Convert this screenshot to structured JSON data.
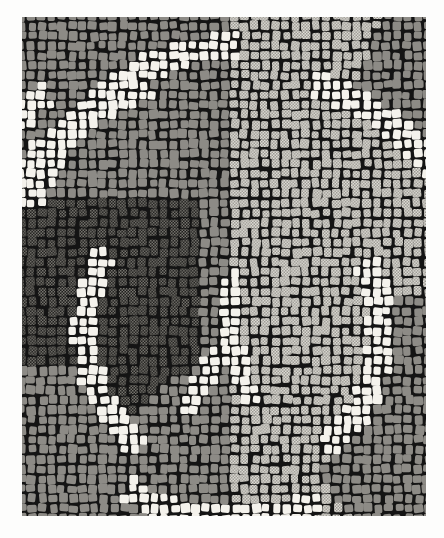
{
  "artwork": {
    "title": "Mosaic pavement with fan-scale (peltae) pattern",
    "medium": "stone tesserae mosaic",
    "orientation": "portrait",
    "image_width": 444,
    "image_height": 538
  },
  "canvas": {
    "background": "#fdfdfc",
    "panel": {
      "x": 22,
      "y": 17,
      "width": 404,
      "height": 499
    },
    "grout_color": "#141414",
    "paper_color": "#fdfdfc"
  },
  "palette": {
    "white_tessera": "#f4f2ec",
    "light_gray_tessera": "#c9c7c0",
    "mid_gray_tessera": "#8d8b86",
    "dark_tessera": "#3b3a38",
    "grout": "#141414",
    "halftone_dot": "#5e5c59"
  },
  "tessera": {
    "nominal_size": 8.5,
    "gap": 2.2,
    "corner_radius": 1.8,
    "jitter": 0.22
  },
  "regions": [
    {
      "id": "field-upper-left",
      "name": "upper-left mid-gray fan field",
      "fill": "mid_gray_tessera",
      "texture": "solid"
    },
    {
      "id": "field-upper-right",
      "name": "upper-right light-gray stippled field",
      "fill": "light_gray_tessera",
      "texture": "halftone"
    },
    {
      "id": "field-left-dark",
      "name": "left dark stippled fan field",
      "fill": "dark_tessera",
      "texture": "halftone"
    },
    {
      "id": "field-right-mid",
      "name": "right mid-gray fan field",
      "fill": "mid_gray_tessera",
      "texture": "solid"
    },
    {
      "id": "field-lower-left",
      "name": "lower-left mid-gray fan field",
      "fill": "mid_gray_tessera",
      "texture": "solid"
    },
    {
      "id": "field-lower-right",
      "name": "lower-right light-gray stippled field",
      "fill": "light_gray_tessera",
      "texture": "halftone"
    }
  ],
  "arcs": [
    {
      "id": "arc-top-left",
      "name": "large white arc band sweeping across upper-left",
      "band_width": 26,
      "fill": "white_tessera",
      "center": [
        232,
        332
      ],
      "radius": 268,
      "start_deg": 150,
      "end_deg": 248
    },
    {
      "id": "arc-upper-right",
      "name": "white arc band bounding upper-right field",
      "band_width": 24,
      "fill": "white_tessera",
      "center": [
        232,
        332
      ],
      "radius": 268,
      "start_deg": 292,
      "end_deg": 352
    },
    {
      "id": "arc-lower-left",
      "name": "white arc band bounding lower-left field",
      "band_width": 25,
      "fill": "white_tessera",
      "center": [
        232,
        332
      ],
      "radius": 150,
      "start_deg": 150,
      "end_deg": 215
    },
    {
      "id": "arc-lower-right",
      "name": "white arc band bounding lower-right field",
      "band_width": 25,
      "fill": "white_tessera",
      "center": [
        232,
        332
      ],
      "radius": 150,
      "start_deg": 330,
      "end_deg": 30
    },
    {
      "id": "arc-center-spoke",
      "name": "white spoke converging at central node",
      "band_width": 22,
      "fill": "white_tessera"
    }
  ],
  "nodes": [
    {
      "id": "node-center",
      "name": "central convergence point",
      "x": 232,
      "y": 332
    },
    {
      "id": "node-upper",
      "name": "upper convergence point",
      "x": 247,
      "y": 272
    }
  ],
  "labels": {
    "alt_text": "Black and white photograph of an ancient mosaic floor composed of small square tesserae arranged in concentric fan bands; white arcs divide fields of mid gray, light gray and dark tesserae."
  }
}
